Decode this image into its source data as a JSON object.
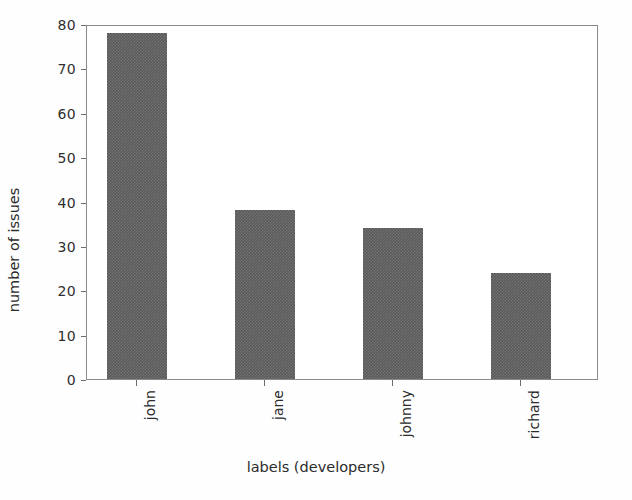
{
  "chart_data": {
    "type": "bar",
    "title": "",
    "categories": [
      "john",
      "jane",
      "johnny",
      "richard"
    ],
    "values": [
      78,
      38,
      34,
      24
    ],
    "series": [
      {
        "name": "number of issues",
        "values": [
          78,
          38,
          34,
          24
        ]
      }
    ],
    "xlabel": "labels (developers)",
    "ylabel": "number of issues",
    "ylim": [
      0,
      80
    ],
    "yticks": [
      0,
      10,
      20,
      30,
      40,
      50,
      60,
      70,
      80
    ],
    "ytick_labels": [
      "0",
      "10",
      "20",
      "30",
      "40",
      "50",
      "60",
      "70",
      "80"
    ],
    "xtick_labels": [
      "john",
      "jane",
      "johnny",
      "richard"
    ],
    "xtick_rotation": 90,
    "grid": false,
    "legend": null,
    "bar_color": "#5b5b5b",
    "axes_color": "#8a8a8a",
    "background_color": "#ffffff"
  }
}
